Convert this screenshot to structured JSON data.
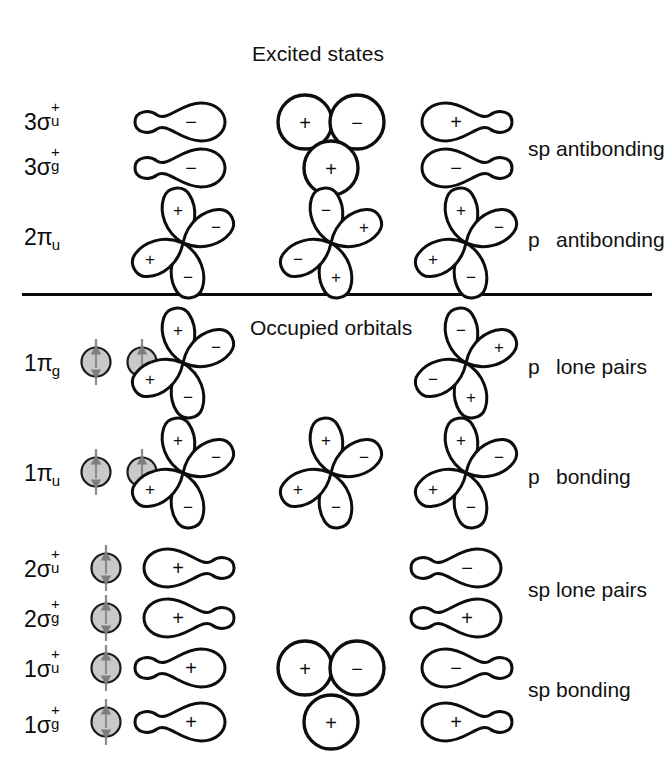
{
  "figure": {
    "title": "Excited states",
    "occupied_section_label": "Occupied orbitals",
    "background_color": "#ffffff",
    "ink_color": "#0d0d0d",
    "electron_fill_color": "#c9c9c9",
    "spin_arrow_color": "#7d7d7d"
  },
  "rows": [
    {
      "id": "3sigma-u-plus",
      "label_main": "3σ",
      "label_sub": "u",
      "label_sup": "+",
      "label_text": "3σu+",
      "electrons": [],
      "orbitals": [
        {
          "column": "left",
          "type": "sp-hybrid",
          "direction": "right",
          "signs": [
            "−"
          ]
        },
        {
          "column": "center",
          "type": "s-pair",
          "signs": [
            "+",
            "−"
          ]
        },
        {
          "column": "right",
          "type": "sp-hybrid",
          "direction": "left",
          "signs": [
            "+"
          ]
        }
      ],
      "right_label_tag": "sp",
      "right_label_text": "antibonding",
      "right_label_row": true
    },
    {
      "id": "3sigma-g-plus",
      "label_main": "3σ",
      "label_sub": "g",
      "label_sup": "+",
      "label_text": "3σg+",
      "electrons": [],
      "orbitals": [
        {
          "column": "left",
          "type": "sp-hybrid",
          "direction": "right",
          "signs": [
            "−"
          ]
        },
        {
          "column": "center",
          "type": "s-single",
          "signs": [
            "+"
          ]
        },
        {
          "column": "right",
          "type": "sp-hybrid",
          "direction": "left",
          "signs": [
            "−"
          ]
        }
      ],
      "right_label_tag": "",
      "right_label_text": ""
    },
    {
      "id": "2pi-u",
      "label_main": "2π",
      "label_sub": "u",
      "label_sup": "",
      "label_text": "2πu",
      "electrons": [],
      "orbitals": [
        {
          "column": "left",
          "type": "p-cross",
          "signs": [
            "+",
            "−",
            "+",
            "−"
          ]
        },
        {
          "column": "center",
          "type": "p-cross",
          "signs": [
            "−",
            "+",
            "−",
            "+"
          ]
        },
        {
          "column": "right",
          "type": "p-cross",
          "signs": [
            "+",
            "−",
            "+",
            "−"
          ]
        }
      ],
      "right_label_tag": "p",
      "right_label_text": "antibonding"
    },
    {
      "id": "1pi-g",
      "label_main": "1π",
      "label_sub": "g",
      "label_sup": "",
      "label_text": "1πg",
      "electrons": [
        "pair",
        "pair"
      ],
      "orbitals": [
        {
          "column": "left",
          "type": "p-cross",
          "signs": [
            "+",
            "−",
            "+",
            "−"
          ]
        },
        {
          "column": "right",
          "type": "p-cross",
          "signs": [
            "−",
            "+",
            "−",
            "+"
          ]
        }
      ],
      "right_label_tag": "p",
      "right_label_text": "lone pairs"
    },
    {
      "id": "1pi-u",
      "label_main": "1π",
      "label_sub": "u",
      "label_sup": "",
      "label_text": "1πu",
      "electrons": [
        "pair",
        "pair"
      ],
      "orbitals": [
        {
          "column": "left",
          "type": "p-cross",
          "signs": [
            "+",
            "−",
            "+",
            "−"
          ]
        },
        {
          "column": "center",
          "type": "p-cross",
          "signs": [
            "+",
            "−",
            "+",
            "−"
          ]
        },
        {
          "column": "right",
          "type": "p-cross",
          "signs": [
            "+",
            "−",
            "+",
            "−"
          ]
        }
      ],
      "right_label_tag": "p",
      "right_label_text": "bonding"
    },
    {
      "id": "2sigma-u-plus",
      "label_main": "2σ",
      "label_sub": "u",
      "label_sup": "+",
      "label_text": "2σu+",
      "electrons": [
        "pair"
      ],
      "orbitals": [
        {
          "column": "left",
          "type": "sp-hybrid",
          "direction": "left",
          "signs": [
            "+"
          ]
        },
        {
          "column": "right",
          "type": "sp-hybrid",
          "direction": "right",
          "signs": [
            "−"
          ]
        }
      ],
      "right_label_tag": "sp",
      "right_label_text": "lone pairs"
    },
    {
      "id": "2sigma-g-plus",
      "label_main": "2σ",
      "label_sub": "g",
      "label_sup": "+",
      "label_text": "2σg+",
      "electrons": [
        "pair"
      ],
      "orbitals": [
        {
          "column": "left",
          "type": "sp-hybrid",
          "direction": "left",
          "signs": [
            "+"
          ]
        },
        {
          "column": "right",
          "type": "sp-hybrid",
          "direction": "right",
          "signs": [
            "+"
          ]
        }
      ],
      "right_label_tag": "",
      "right_label_text": ""
    },
    {
      "id": "1sigma-u-plus",
      "label_main": "1σ",
      "label_sub": "u",
      "label_sup": "+",
      "label_text": "1σu+",
      "electrons": [
        "pair"
      ],
      "orbitals": [
        {
          "column": "left",
          "type": "sp-hybrid",
          "direction": "right",
          "signs": [
            "+"
          ]
        },
        {
          "column": "center",
          "type": "s-pair",
          "signs": [
            "+",
            "−"
          ]
        },
        {
          "column": "right",
          "type": "sp-hybrid",
          "direction": "left",
          "signs": [
            "−"
          ]
        }
      ],
      "right_label_tag": "sp",
      "right_label_text": "bonding"
    },
    {
      "id": "1sigma-g-plus",
      "label_main": "1σ",
      "label_sub": "g",
      "label_sup": "+",
      "label_text": "1σg+",
      "electrons": [
        "pair"
      ],
      "orbitals": [
        {
          "column": "left",
          "type": "sp-hybrid",
          "direction": "right",
          "signs": [
            "+"
          ]
        },
        {
          "column": "center",
          "type": "s-single",
          "signs": [
            "+"
          ]
        },
        {
          "column": "right",
          "type": "sp-hybrid",
          "direction": "left",
          "signs": [
            "+"
          ]
        }
      ],
      "right_label_tag": "",
      "right_label_text": ""
    }
  ],
  "right_labels": [
    {
      "id": "sp-antibonding",
      "tag": "sp",
      "text": "antibonding"
    },
    {
      "id": "p-antibonding",
      "tag": "p",
      "text": "antibonding"
    },
    {
      "id": "p-lone-pairs",
      "tag": "p",
      "text": "lone pairs"
    },
    {
      "id": "p-bonding",
      "tag": "p",
      "text": "bonding"
    },
    {
      "id": "sp-lone-pairs",
      "tag": "sp",
      "text": "lone pairs"
    },
    {
      "id": "sp-bonding",
      "tag": "sp",
      "text": "bonding"
    }
  ]
}
